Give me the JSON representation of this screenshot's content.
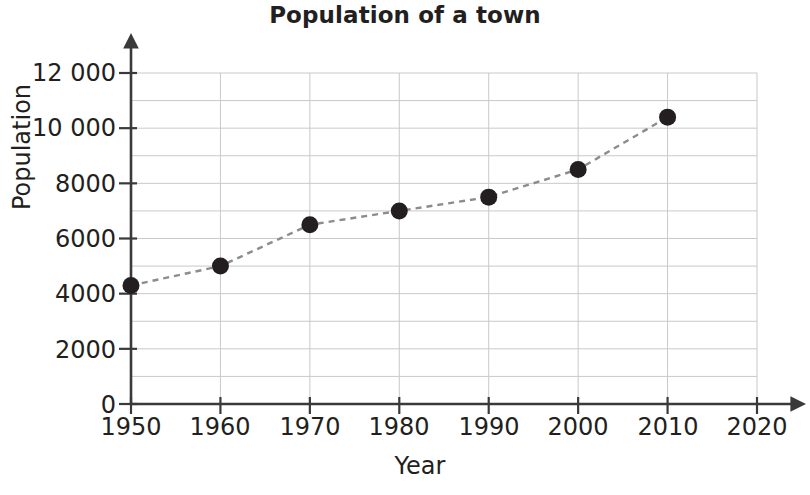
{
  "chart_data": {
    "type": "line",
    "title": "Population of a town",
    "xlabel": "Year",
    "ylabel": "Population",
    "x": [
      1950,
      1960,
      1970,
      1980,
      1990,
      2000,
      2010
    ],
    "values": [
      4300,
      5000,
      6500,
      7000,
      7500,
      8500,
      10400
    ],
    "series": [
      {
        "name": "Population",
        "values": [
          4300,
          5000,
          6500,
          7000,
          7500,
          8500,
          10400
        ]
      }
    ],
    "xlim": [
      1950,
      2020
    ],
    "ylim": [
      0,
      12000
    ],
    "xticks": [
      1950,
      1960,
      1970,
      1980,
      1990,
      2000,
      2010,
      2020
    ],
    "xtick_labels": [
      "1950",
      "1960",
      "1970",
      "1980",
      "1990",
      "2000",
      "2010",
      "2020"
    ],
    "yticks": [
      0,
      2000,
      4000,
      6000,
      8000,
      10000,
      12000
    ],
    "ytick_labels": [
      "0",
      "2000",
      "4000",
      "6000",
      "8000",
      "10 000",
      "12 000"
    ],
    "y_minor_step": 1000,
    "grid": true,
    "grid_color": "#c9c9c9",
    "legend": null,
    "line_style": "dashed",
    "line_color": "#8c8c8c",
    "marker": "circle",
    "marker_color": "#231f20",
    "axis_color": "#4a4a4a",
    "text_color": "#231f20"
  }
}
